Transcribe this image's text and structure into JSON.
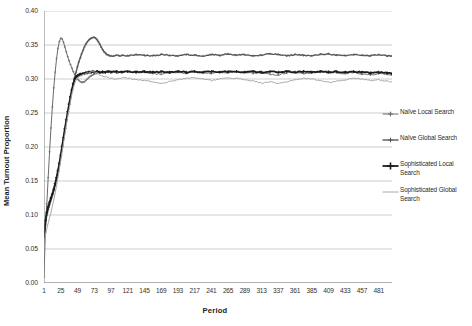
{
  "chart_data": {
    "type": "line",
    "title": "",
    "xlabel": "Period",
    "ylabel": "Mean Turnout Proportion",
    "xlim": [
      1,
      500
    ],
    "ylim": [
      0.0,
      0.4
    ],
    "ytick_step": 0.05,
    "xtick_step": 24,
    "grid": "horizontal",
    "legend_position": "right",
    "ytick_labels": [
      "0.40",
      "0.35",
      "0.30",
      "0.25",
      "0.20",
      "0.15",
      "0.10",
      "0.05",
      "0.00"
    ],
    "ytick_values": [
      0.4,
      0.35,
      0.3,
      0.25,
      0.2,
      0.15,
      0.1,
      0.05,
      0.0
    ],
    "xtick_labels": [
      "1",
      "25",
      "49",
      "73",
      "97",
      "121",
      "145",
      "169",
      "193",
      "217",
      "241",
      "265",
      "289",
      "313",
      "337",
      "361",
      "385",
      "409",
      "433",
      "457",
      "481"
    ],
    "xtick_values": [
      1,
      25,
      49,
      73,
      97,
      121,
      145,
      169,
      193,
      217,
      241,
      265,
      289,
      313,
      337,
      361,
      385,
      409,
      433,
      457,
      481
    ],
    "series": [
      {
        "name": "Naïve Local Search",
        "color": "#6b6b6b",
        "width": 1.0,
        "marker": "cross",
        "x": [
          1,
          3,
          5,
          7,
          9,
          11,
          13,
          15,
          17,
          19,
          21,
          23,
          25,
          27,
          29,
          31,
          33,
          35,
          37,
          39,
          41,
          43,
          45,
          47,
          49,
          51,
          53,
          55,
          57,
          59,
          61,
          63,
          65,
          67,
          69,
          71,
          73,
          77,
          81,
          85,
          89,
          93,
          97,
          105,
          113,
          121,
          133,
          145,
          157,
          169,
          181,
          193,
          205,
          217,
          229,
          241,
          253,
          265,
          277,
          289,
          301,
          313,
          325,
          337,
          349,
          361,
          373,
          385,
          397,
          409,
          421,
          433,
          445,
          457,
          469,
          481,
          493,
          500
        ],
        "y": [
          0.009,
          0.075,
          0.116,
          0.155,
          0.193,
          0.228,
          0.259,
          0.287,
          0.31,
          0.33,
          0.345,
          0.355,
          0.36,
          0.359,
          0.354,
          0.347,
          0.34,
          0.333,
          0.327,
          0.321,
          0.316,
          0.311,
          0.307,
          0.303,
          0.3,
          0.298,
          0.296,
          0.295,
          0.295,
          0.296,
          0.298,
          0.3,
          0.302,
          0.304,
          0.305,
          0.306,
          0.307,
          0.308,
          0.309,
          0.309,
          0.31,
          0.31,
          0.31,
          0.309,
          0.31,
          0.311,
          0.309,
          0.31,
          0.308,
          0.307,
          0.309,
          0.31,
          0.308,
          0.311,
          0.309,
          0.308,
          0.31,
          0.309,
          0.311,
          0.31,
          0.308,
          0.309,
          0.307,
          0.306,
          0.309,
          0.31,
          0.308,
          0.309,
          0.31,
          0.311,
          0.309,
          0.308,
          0.31,
          0.307,
          0.306,
          0.308,
          0.307,
          0.306
        ]
      },
      {
        "name": "Naïve Global Search",
        "color": "#595959",
        "width": 1.4,
        "marker": "cross",
        "x": [
          1,
          3,
          5,
          7,
          9,
          11,
          13,
          15,
          17,
          19,
          21,
          23,
          25,
          27,
          29,
          31,
          33,
          35,
          37,
          39,
          41,
          43,
          45,
          47,
          49,
          51,
          53,
          55,
          57,
          59,
          61,
          63,
          65,
          67,
          69,
          71,
          73,
          75,
          77,
          79,
          81,
          83,
          85,
          87,
          89,
          91,
          93,
          95,
          97,
          101,
          105,
          109,
          113,
          121,
          133,
          145,
          157,
          169,
          181,
          193,
          205,
          217,
          229,
          241,
          253,
          265,
          277,
          289,
          301,
          313,
          325,
          337,
          349,
          361,
          373,
          385,
          397,
          409,
          421,
          433,
          445,
          457,
          469,
          481,
          493,
          500
        ],
        "y": [
          0.062,
          0.086,
          0.1,
          0.108,
          0.115,
          0.122,
          0.129,
          0.136,
          0.144,
          0.153,
          0.163,
          0.174,
          0.186,
          0.199,
          0.212,
          0.225,
          0.238,
          0.25,
          0.262,
          0.273,
          0.283,
          0.293,
          0.302,
          0.31,
          0.318,
          0.325,
          0.331,
          0.337,
          0.342,
          0.347,
          0.351,
          0.354,
          0.357,
          0.359,
          0.36,
          0.361,
          0.361,
          0.36,
          0.358,
          0.355,
          0.351,
          0.347,
          0.343,
          0.34,
          0.338,
          0.336,
          0.335,
          0.334,
          0.334,
          0.334,
          0.335,
          0.334,
          0.335,
          0.334,
          0.336,
          0.335,
          0.334,
          0.336,
          0.335,
          0.334,
          0.336,
          0.335,
          0.334,
          0.336,
          0.335,
          0.337,
          0.335,
          0.336,
          0.334,
          0.335,
          0.337,
          0.336,
          0.334,
          0.336,
          0.335,
          0.334,
          0.336,
          0.337,
          0.335,
          0.334,
          0.336,
          0.335,
          0.334,
          0.336,
          0.334,
          0.334
        ]
      },
      {
        "name": "Sophisticated Local Search",
        "color": "#1c1c1c",
        "width": 1.8,
        "marker": "cross-bold",
        "x": [
          1,
          3,
          5,
          7,
          9,
          11,
          13,
          15,
          17,
          19,
          21,
          23,
          25,
          27,
          29,
          31,
          33,
          35,
          37,
          39,
          41,
          43,
          45,
          47,
          49,
          51,
          53,
          55,
          57,
          59,
          61,
          63,
          65,
          67,
          69,
          71,
          73,
          77,
          81,
          85,
          89,
          93,
          97,
          105,
          113,
          121,
          133,
          145,
          157,
          169,
          181,
          193,
          205,
          217,
          229,
          241,
          253,
          265,
          277,
          289,
          301,
          313,
          325,
          337,
          349,
          361,
          373,
          385,
          397,
          409,
          421,
          433,
          445,
          457,
          469,
          481,
          493,
          500
        ],
        "y": [
          0.068,
          0.092,
          0.104,
          0.112,
          0.119,
          0.125,
          0.131,
          0.138,
          0.146,
          0.155,
          0.165,
          0.176,
          0.188,
          0.201,
          0.214,
          0.227,
          0.24,
          0.252,
          0.263,
          0.274,
          0.284,
          0.293,
          0.3,
          0.303,
          0.305,
          0.306,
          0.307,
          0.307,
          0.308,
          0.308,
          0.309,
          0.309,
          0.31,
          0.31,
          0.31,
          0.311,
          0.31,
          0.311,
          0.31,
          0.311,
          0.31,
          0.311,
          0.31,
          0.311,
          0.31,
          0.311,
          0.31,
          0.311,
          0.31,
          0.311,
          0.31,
          0.311,
          0.31,
          0.311,
          0.31,
          0.311,
          0.31,
          0.311,
          0.311,
          0.31,
          0.311,
          0.31,
          0.311,
          0.31,
          0.311,
          0.31,
          0.311,
          0.31,
          0.311,
          0.31,
          0.311,
          0.31,
          0.311,
          0.31,
          0.309,
          0.31,
          0.309,
          0.308
        ]
      },
      {
        "name": "Sophisticated Global Search",
        "color": "#a8a8a8",
        "width": 1.0,
        "marker": "line",
        "x": [
          1,
          3,
          5,
          7,
          9,
          11,
          13,
          15,
          17,
          19,
          21,
          23,
          25,
          27,
          29,
          31,
          33,
          35,
          37,
          39,
          41,
          43,
          45,
          47,
          49,
          51,
          53,
          55,
          57,
          59,
          61,
          63,
          65,
          67,
          69,
          71,
          73,
          77,
          81,
          85,
          89,
          93,
          97,
          105,
          113,
          121,
          133,
          145,
          157,
          169,
          181,
          193,
          205,
          217,
          229,
          241,
          253,
          265,
          277,
          289,
          301,
          313,
          325,
          337,
          349,
          361,
          373,
          385,
          397,
          409,
          421,
          433,
          445,
          457,
          469,
          481,
          493,
          500
        ],
        "y": [
          0.056,
          0.07,
          0.08,
          0.088,
          0.096,
          0.104,
          0.113,
          0.122,
          0.132,
          0.143,
          0.155,
          0.167,
          0.18,
          0.193,
          0.206,
          0.219,
          0.232,
          0.244,
          0.256,
          0.267,
          0.277,
          0.286,
          0.293,
          0.298,
          0.301,
          0.303,
          0.304,
          0.305,
          0.306,
          0.307,
          0.308,
          0.309,
          0.309,
          0.31,
          0.31,
          0.311,
          0.31,
          0.309,
          0.306,
          0.304,
          0.303,
          0.302,
          0.301,
          0.3,
          0.302,
          0.301,
          0.299,
          0.298,
          0.296,
          0.293,
          0.296,
          0.299,
          0.301,
          0.302,
          0.3,
          0.298,
          0.3,
          0.302,
          0.301,
          0.299,
          0.297,
          0.294,
          0.296,
          0.293,
          0.296,
          0.299,
          0.301,
          0.3,
          0.298,
          0.295,
          0.297,
          0.299,
          0.301,
          0.3,
          0.298,
          0.299,
          0.297,
          0.296
        ]
      }
    ]
  },
  "axes": {
    "ylabel": "Mean Turnout Proportion",
    "xlabel": "Period"
  },
  "legend": {
    "items": [
      {
        "label": "Naïve Local Search"
      },
      {
        "label": "Naïve Global Search"
      },
      {
        "label": "Sophisticated Local Search"
      },
      {
        "label": "Sophisticated Global Search"
      }
    ]
  },
  "colors": {
    "gridline": "#b9b9b9",
    "axis": "#7d7d7d",
    "background": "#ffffff"
  }
}
